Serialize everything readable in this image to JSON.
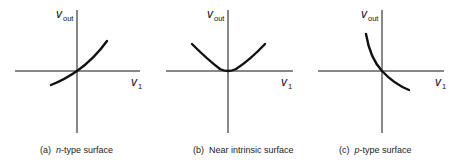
{
  "figure": {
    "panels": [
      {
        "id": "a",
        "y_axis_label": "v",
        "y_axis_sub": "out",
        "x_axis_label": "v",
        "x_axis_sub": "1",
        "caption_prefix": "(a)",
        "caption_italic": "n",
        "caption_rest": "-type surface",
        "curve_shape": "monotonically increasing, concave up, passes through origin"
      },
      {
        "id": "b",
        "y_axis_label": "v",
        "y_axis_sub": "out",
        "x_axis_label": "v",
        "x_axis_sub": "1",
        "caption_prefix": "(b)",
        "caption_italic": "",
        "caption_rest": "Near intrinsic surface",
        "curve_shape": "symmetric V/parabola with minimum at origin"
      },
      {
        "id": "c",
        "y_axis_label": "v",
        "y_axis_sub": "out",
        "x_axis_label": "v",
        "x_axis_sub": "1",
        "caption_prefix": "(c)",
        "caption_italic": "p",
        "caption_rest": "-type surface",
        "curve_shape": "monotonically decreasing, concave up, passes through origin"
      }
    ],
    "colors": {
      "ink": "#111111",
      "background": "#ffffff"
    }
  }
}
